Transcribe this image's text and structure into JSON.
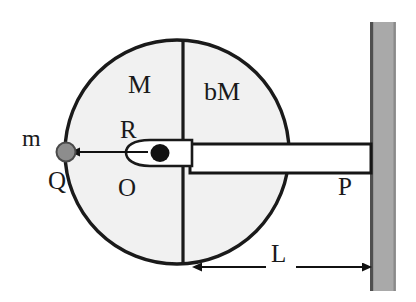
{
  "diagram": {
    "labels": {
      "left_half_mass": "M",
      "right_half_mass": "bM",
      "radius": "R",
      "point_mass": "m",
      "point_on_rim": "Q",
      "center_axis": "O",
      "rod_end_at_wall": "P",
      "rod_length": "L"
    },
    "colors": {
      "disk_fill": "#f1f1f1",
      "disk_outline": "#1a1a1a",
      "point_mass_fill": "#8d8d8d",
      "point_mass_outline": "#4a4a4a",
      "hub_fill": "#ffffff",
      "hub_outline": "#1a1a1a",
      "axis_dot": "#111111",
      "rod_fill": "#ffffff",
      "rod_outline": "#161616",
      "wall_fill": "#a9a9a9",
      "wall_edge": "#4d4d4d",
      "text": "#1a1a1a"
    },
    "geometry": {
      "disk_center_x": 177,
      "disk_center_y": 152,
      "disk_radius": 112,
      "divider_x": 183,
      "rod_left_x": 190,
      "rod_right_x": 371,
      "rod_top_y": 144,
      "rod_bottom_y": 173,
      "wall_left_x": 370,
      "wall_right_x": 396,
      "wall_top_y": 22,
      "wall_bottom_y": 291,
      "mass_center_x": 66,
      "mass_center_y": 152,
      "mass_radius": 9,
      "dimension_line_y": 267,
      "dimension_left_x": 194,
      "dimension_right_x": 369
    }
  }
}
